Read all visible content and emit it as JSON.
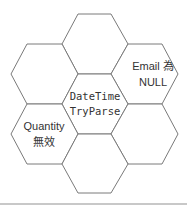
{
  "diagram": {
    "type": "hexagon-cluster",
    "stroke_color": "#7a7a7a",
    "text_color": "#333333",
    "divider_color": "#c8c8c8",
    "hexagons": [
      {
        "id": "top",
        "lines": []
      },
      {
        "id": "upper-left",
        "lines": []
      },
      {
        "id": "upper-right",
        "lines": [
          "Email 為",
          "NULL"
        ]
      },
      {
        "id": "center",
        "lines": [
          "DateTime",
          "TryParse"
        ]
      },
      {
        "id": "lower-left",
        "lines": [
          "Quantity",
          "無效"
        ]
      },
      {
        "id": "lower-right",
        "lines": []
      },
      {
        "id": "bottom",
        "lines": []
      }
    ]
  }
}
